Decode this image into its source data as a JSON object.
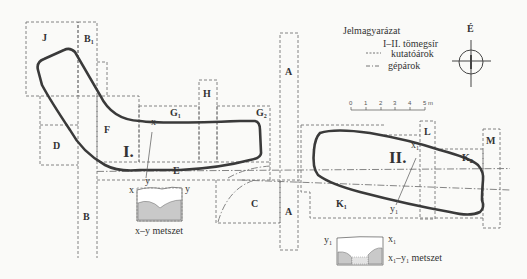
{
  "legend": {
    "title": "Jelmagyarázat",
    "items": [
      {
        "symbol": "roman-numerals",
        "label": "I–II. tömegsír"
      },
      {
        "symbol": "dashed-line",
        "label": "kutatóárok"
      },
      {
        "symbol": "dash-dot-line",
        "label": "gépárok"
      }
    ]
  },
  "compass": {
    "north_label": "É"
  },
  "scale_bar": {
    "ticks": [
      "0",
      "1",
      "2",
      "3",
      "4",
      "5 m"
    ]
  },
  "trenches": {
    "J": "J",
    "B1": "B",
    "B1_sub": "1",
    "F": "F",
    "D": "D",
    "B": "B",
    "G1": "G",
    "G1_sub": "1",
    "G2": "G",
    "G2_sub": "2",
    "H": "H",
    "A_top": "A",
    "A_bottom": "A",
    "E": "E",
    "C": "C",
    "K1": "K",
    "K1_sub": "1",
    "K2": "K",
    "K2_sub": "2",
    "L": "L",
    "M": "M"
  },
  "graves": {
    "I": "I.",
    "II": "II."
  },
  "section_points": {
    "x": "x",
    "y": "y",
    "x1": "x",
    "x1_sub": "1",
    "y1": "y",
    "y1_sub": "1"
  },
  "sections": {
    "xy": {
      "left": "x",
      "right": "y",
      "caption": "x–y metszet"
    },
    "x1y1": {
      "left": "y",
      "left_sub": "1",
      "right": "x",
      "right_sub": "1",
      "caption_a": "x",
      "caption_a_sub": "1",
      "caption_b": "–y",
      "caption_b_sub": "1",
      "caption_c": " metszet"
    }
  },
  "colors": {
    "outline": "#3a3a3a",
    "dash": "#777777",
    "fill": "#c9c9c9",
    "background": "#fafaf8"
  }
}
